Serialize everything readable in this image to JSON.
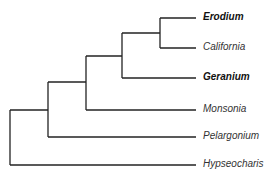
{
  "tree": {
    "line_color": "#222222",
    "taxa": [
      {
        "name": "Erodium",
        "bold": true
      },
      {
        "name": "California",
        "bold": false
      },
      {
        "name": "Geranium",
        "bold": true
      },
      {
        "name": "Monsonia",
        "bold": false
      },
      {
        "name": "Pelargonium",
        "bold": false
      },
      {
        "name": "Hypseocharis",
        "bold": false
      }
    ]
  }
}
